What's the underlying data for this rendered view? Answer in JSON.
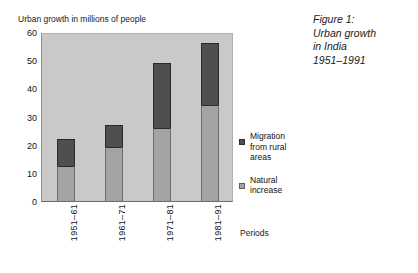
{
  "top_cut_row": {
    "text": "·     ···     ·  ·      ··     ··"
  },
  "figure_caption": {
    "lines": [
      "Figure 1:",
      "Urban growth",
      "in India",
      "1951–1991"
    ]
  },
  "legend": {
    "position": "right",
    "entries": [
      {
        "label_lines": [
          "Migration",
          "from rural",
          "areas"
        ],
        "color": "#4f4f4f",
        "swatch": "dark"
      },
      {
        "label_lines": [
          "Natural",
          "increase"
        ],
        "color": "#a3a3a3",
        "swatch": "light"
      }
    ]
  },
  "chart_data": {
    "type": "bar",
    "subtype": "stacked-vertical",
    "title": "",
    "ylabel": "Urban growth in millions of people",
    "xlabel": "Periods",
    "categories": [
      "1951–61",
      "1961–71",
      "1971–81",
      "1981–91"
    ],
    "series": [
      {
        "name": "Natural increase",
        "color": "#a3a3a3",
        "values": [
          12.5,
          19,
          26,
          34
        ]
      },
      {
        "name": "Migration from rural areas",
        "color": "#4f4f4f",
        "values": [
          9.5,
          8,
          23,
          22
        ]
      }
    ],
    "totals": [
      22,
      27,
      49,
      56
    ],
    "ylim": [
      0,
      60
    ],
    "yticks": [
      0,
      10,
      20,
      30,
      40,
      50,
      60
    ],
    "ytick_labels": [
      "0",
      "10",
      "20",
      "30",
      "40",
      "50",
      "60"
    ],
    "grid": false,
    "plot_background": "#c9c9c9",
    "legend_position": "right"
  }
}
